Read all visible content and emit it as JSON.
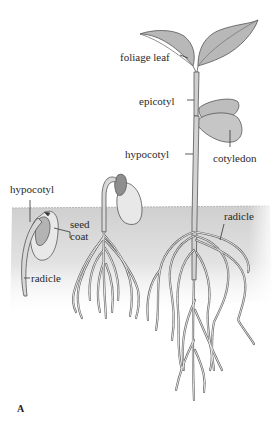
{
  "figure": {
    "panel_letter": "A",
    "colors": {
      "soil": "#d8d8d8",
      "soil_edge": "#c4c4c4",
      "leaf": "#b9b9b9",
      "leaf_dark": "#7a7a7a",
      "stem": "#d0d0d0",
      "seed": "#e6e6e6",
      "outline": "#555555",
      "text": "#2a2a2a",
      "background": "#ffffff"
    },
    "stages": [
      {
        "name": "early-germination",
        "labels": {
          "hypocotyl": "hypocotyl",
          "seed_coat_line1": "seed",
          "seed_coat_line2": "coat",
          "radicle": "radicle"
        }
      },
      {
        "name": "hook-emergence",
        "labels": {}
      },
      {
        "name": "established-seedling",
        "labels": {
          "foliage_leaf": "foliage leaf",
          "epicotyl": "epicotyl",
          "hypocotyl": "hypocotyl",
          "cotyledon": "cotyledon",
          "radicle": "radicle"
        }
      }
    ]
  }
}
